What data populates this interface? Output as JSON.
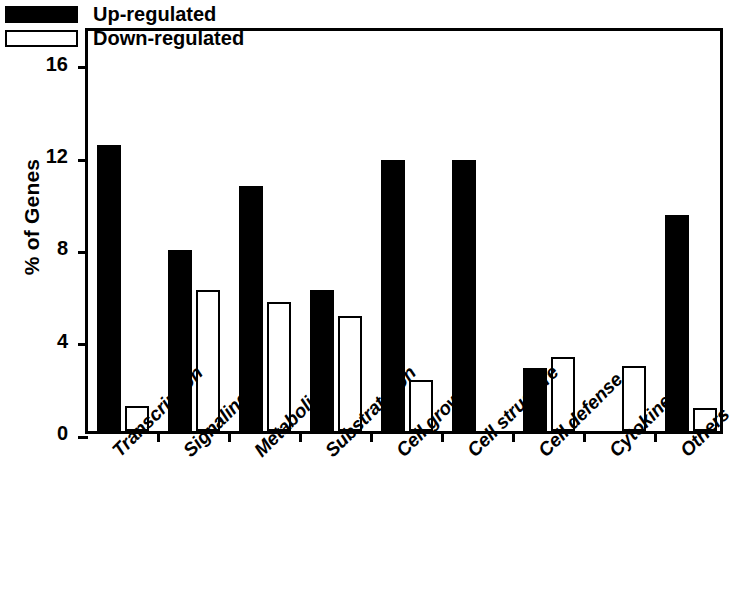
{
  "chart_data": {
    "type": "bar",
    "title": "",
    "xlabel": "",
    "ylabel": "% of Genes",
    "ylim": [
      0,
      17.6
    ],
    "yticks": [
      0,
      4,
      8,
      12,
      16
    ],
    "ytick_labels": [
      "0",
      "4",
      "8",
      "12",
      "16"
    ],
    "grid": false,
    "legend_position": "top-left",
    "categories": [
      "Transcription",
      "Signaling",
      "Metabolism",
      "Substrate/Ion",
      "Cell growth",
      "Cell structure",
      "Cell defense",
      "Cytokines",
      "Others"
    ],
    "series": [
      {
        "name": "Up-regulated",
        "color": "#000000",
        "fill": "solid",
        "values": [
          12.4,
          7.85,
          10.6,
          6.1,
          11.75,
          11.75,
          2.75,
          0,
          9.35
        ]
      },
      {
        "name": "Down-regulated",
        "color": "#ffffff",
        "fill": "outline",
        "values": [
          1.1,
          6.1,
          5.6,
          5.0,
          2.2,
          0,
          3.2,
          2.8,
          1.0
        ]
      }
    ]
  },
  "legend": {
    "entries": [
      {
        "label": "Up-regulated",
        "style": "up"
      },
      {
        "label": "Down-regulated",
        "style": "down"
      }
    ]
  },
  "caption": {
    "fragment": ""
  }
}
